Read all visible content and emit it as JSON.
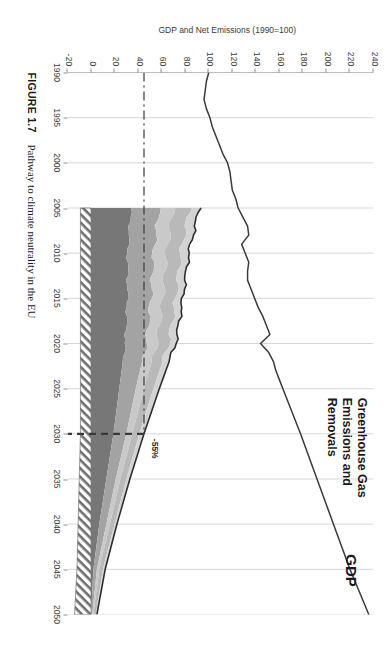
{
  "figure": {
    "number_label": "FIGURE 1.7",
    "caption_text": "Pathway to climate neutrality in the EU"
  },
  "annotations": {
    "gdp_label": "GDP",
    "ghg_label_line1": "Greenhouse Gas",
    "ghg_label_line2": "Emissions and",
    "ghg_label_line3": "Removals",
    "target_label": "-55%"
  },
  "colors": {
    "band_lightest": "#d3d3d3",
    "band_light": "#b9b9b9",
    "band_pale": "#c9c9c9",
    "band_mid": "#a3a3a3",
    "band_dark": "#8d8d8d",
    "band_darkest": "#777777",
    "gdp_line": "#3a3a3a",
    "net_line": "#2e2e2e",
    "gridline": "#d7d7d7",
    "axis": "#8f8f8f",
    "hatch": "#6e6e6e"
  },
  "chart_data": {
    "type": "area",
    "title": "",
    "xlabel": "",
    "ylabel": "GDP and Net Emissions (1990=100)",
    "xlim": [
      1990,
      2050
    ],
    "ylim": [
      -20,
      240
    ],
    "grid": true,
    "legend_position": "none",
    "x_ticks": [
      1990,
      1995,
      2000,
      2005,
      2010,
      2015,
      2020,
      2025,
      2030,
      2035,
      2040,
      2045,
      2050
    ],
    "y_ticks": [
      -20,
      0,
      20,
      40,
      60,
      80,
      100,
      120,
      140,
      160,
      180,
      200,
      220,
      240
    ],
    "markers": [
      {
        "name": "2030 target",
        "x": 2030,
        "y": 45,
        "label": "-55%"
      }
    ],
    "series": [
      {
        "name": "GDP",
        "type": "line",
        "x": [
          1990,
          1991,
          1992,
          1993,
          1994,
          1995,
          1996,
          1997,
          1998,
          1999,
          2000,
          2001,
          2002,
          2003,
          2004,
          2005,
          2006,
          2007,
          2008,
          2009,
          2010,
          2011,
          2012,
          2013,
          2014,
          2015,
          2016,
          2017,
          2018,
          2019,
          2020,
          2021,
          2022,
          2023,
          2024,
          2025,
          2030,
          2035,
          2040,
          2045,
          2050
        ],
        "values": [
          100,
          98,
          97,
          96,
          98,
          101,
          103,
          106,
          109,
          112,
          116,
          118,
          119,
          120,
          123,
          125,
          129,
          133,
          134,
          128,
          131,
          134,
          133,
          133,
          136,
          139,
          142,
          146,
          149,
          152,
          144,
          151,
          155,
          157,
          160,
          163,
          178,
          192,
          206,
          220,
          236
        ]
      },
      {
        "name": "Net emissions",
        "type": "line",
        "x": [
          2005,
          2010,
          2015,
          2020,
          2025,
          2030,
          2035,
          2040,
          2045,
          2050
        ],
        "values": [
          92,
          83,
          78,
          72,
          58,
          45,
          33,
          22,
          12,
          2
        ]
      },
      {
        "name": "Band 1 (top, lightest)",
        "type": "area",
        "x": [
          2005,
          2010,
          2015,
          2020,
          2025,
          2030,
          2035,
          2040,
          2045,
          2050
        ],
        "values": [
          8,
          7,
          6,
          6,
          5,
          4,
          3,
          2,
          2,
          1
        ]
      },
      {
        "name": "Band 2",
        "type": "area",
        "x": [
          2005,
          2010,
          2015,
          2020,
          2025,
          2030,
          2035,
          2040,
          2045,
          2050
        ],
        "values": [
          14,
          12,
          11,
          10,
          8,
          6,
          5,
          4,
          3,
          2
        ]
      },
      {
        "name": "Band 3 (pale)",
        "type": "area",
        "x": [
          2005,
          2010,
          2015,
          2020,
          2025,
          2030,
          2035,
          2040,
          2045,
          2050
        ],
        "values": [
          12,
          11,
          10,
          9,
          7,
          5,
          4,
          3,
          2,
          1
        ]
      },
      {
        "name": "Band 4 (mid)",
        "type": "area",
        "x": [
          2005,
          2010,
          2015,
          2020,
          2025,
          2030,
          2035,
          2040,
          2045,
          2050
        ],
        "values": [
          24,
          22,
          20,
          18,
          14,
          11,
          8,
          6,
          3,
          1
        ]
      },
      {
        "name": "Band 5 (darkest)",
        "type": "area",
        "x": [
          2005,
          2010,
          2015,
          2020,
          2025,
          2030,
          2035,
          2040,
          2045,
          2050
        ],
        "values": [
          34,
          31,
          31,
          29,
          24,
          19,
          13,
          7,
          2,
          0
        ]
      },
      {
        "name": "Removals (hatched, below zero)",
        "type": "area",
        "x": [
          2005,
          2010,
          2015,
          2020,
          2025,
          2030,
          2035,
          2040,
          2045,
          2050
        ],
        "values": [
          -9,
          -9,
          -9,
          -9,
          -9,
          -9,
          -10,
          -11,
          -12,
          -14
        ]
      }
    ]
  }
}
